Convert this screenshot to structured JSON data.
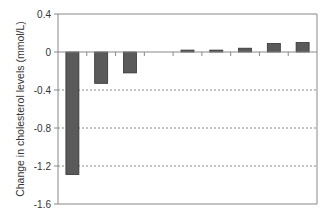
{
  "chart_data": {
    "type": "bar",
    "title": "",
    "xlabel": "",
    "ylabel": "Change in cholesterol levels (mmol/L)",
    "ylim": [
      -1.6,
      0.4
    ],
    "yticks": [
      0.4,
      0,
      -0.4,
      -0.8,
      -1.2,
      -1.6
    ],
    "ytick_labels": [
      "0.4",
      "0",
      "-0.4",
      "-0.8",
      "-1.2",
      "-1.6"
    ],
    "categories": [
      "1",
      "2",
      "3",
      "4",
      "5",
      "6",
      "7",
      "8",
      "9"
    ],
    "category_labels_visible": false,
    "values": [
      -1.29,
      -0.33,
      -0.22,
      0,
      0.02,
      0.02,
      0.04,
      0.09,
      0.1
    ],
    "grid": {
      "horizontal": true,
      "style": "dotted",
      "at": [
        -0.4,
        -0.8,
        -1.2
      ]
    },
    "legend": null,
    "colors": {
      "bar": "#5a5a5a",
      "bar_edge": "#333333",
      "axis": "#888888",
      "grid": "#888888"
    }
  }
}
